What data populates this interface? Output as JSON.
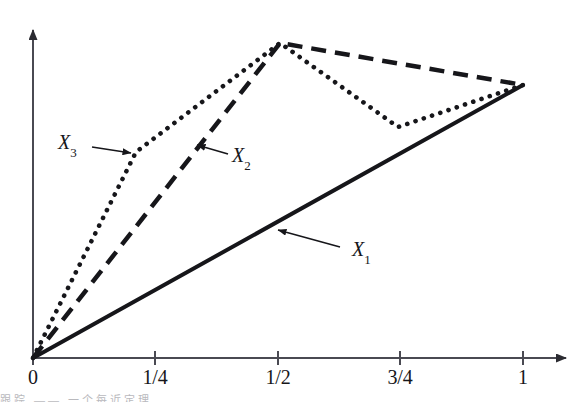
{
  "figure": {
    "background_color": "#ffffff",
    "ink_color": "#16161a",
    "axis_color": "#4a4a52",
    "caption_partial": "跟踪     ——     一个每近定理"
  },
  "axes": {
    "x_ticks": [
      {
        "label": "0",
        "value": 0,
        "px": 33
      },
      {
        "label": "1/4",
        "value": 0.25,
        "px": 155
      },
      {
        "label": "1/2",
        "value": 0.5,
        "px": 278
      },
      {
        "label": "3/4",
        "value": 0.75,
        "px": 400
      },
      {
        "label": "1",
        "value": 1,
        "px": 523
      }
    ],
    "x_axis_y_px": 358,
    "y_axis_x_px": 33,
    "x_arrow_tip_px": 577,
    "y_arrow_tip_px": 22,
    "y_ticks": [],
    "grid": false
  },
  "labels": {
    "x1": {
      "text": "X",
      "sub": "1",
      "x": 352,
      "y": 240,
      "arrow_from_x": 340,
      "arrow_from_y": 247,
      "arrow_to_x": 276,
      "arrow_to_y": 229
    },
    "x2": {
      "text": "X",
      "sub": "2",
      "x": 232,
      "y": 146,
      "arrow_from_x": 226,
      "arrow_from_y": 153,
      "arrow_to_x": 195,
      "arrow_to_y": 144
    },
    "x3": {
      "text": "X",
      "sub": "3",
      "x": 58,
      "y": 133,
      "arrow_from_x": 92,
      "arrow_from_y": 147,
      "arrow_to_x": 133,
      "arrow_to_y": 153
    }
  },
  "chart_data": {
    "type": "line",
    "title": "",
    "xlabel": "",
    "ylabel": "",
    "xlim": [
      0,
      1.0
    ],
    "ylim": [
      0,
      1.15
    ],
    "grid": false,
    "legend": "inline-annotations",
    "x_tick_labels": [
      "0",
      "1/4",
      "1/2",
      "3/4",
      "1"
    ],
    "x_tick_values": [
      0,
      0.25,
      0.5,
      0.75,
      1
    ],
    "series": [
      {
        "name": "X1",
        "style": "solid",
        "x": [
          0,
          1
        ],
        "y": [
          0,
          0.812
        ],
        "points_px": [
          [
            33,
            358
          ],
          [
            523,
            85
          ]
        ]
      },
      {
        "name": "X2",
        "style": "dashed",
        "x": [
          0,
          0.5,
          1
        ],
        "y": [
          0,
          0.94,
          0.812
        ],
        "points_px": [
          [
            33,
            358
          ],
          [
            280,
            43
          ],
          [
            523,
            85
          ]
        ]
      },
      {
        "name": "X3",
        "style": "dotted",
        "x": [
          0,
          0.2115,
          0.5,
          0.7465,
          1
        ],
        "y": [
          0,
          0.613,
          0.94,
          0.693,
          0.812
        ],
        "points_px": [
          [
            33,
            358
          ],
          [
            136,
            152
          ],
          [
            280,
            43
          ],
          [
            398,
            127
          ],
          [
            523,
            85
          ]
        ]
      }
    ]
  }
}
